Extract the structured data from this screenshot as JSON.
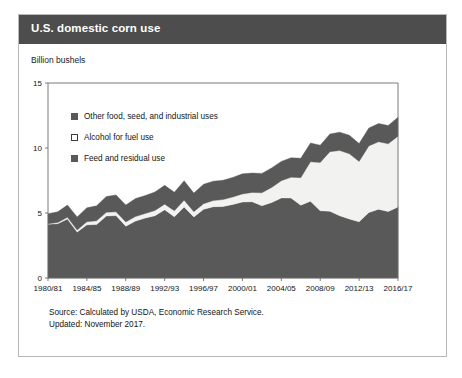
{
  "card": {
    "title": "U.S. domestic corn use",
    "header_color": "#4d4d4d",
    "border_color": "#b8b8b8"
  },
  "axis_label": "Billion bushels",
  "legend": {
    "items": [
      {
        "label": "Other food, seed, and industrial uses",
        "swatch": "filled",
        "color": "#595959"
      },
      {
        "label": "Alcohol for fuel use",
        "swatch": "hollow",
        "color": "#ffffff"
      },
      {
        "label": "Feed and residual use",
        "swatch": "filled",
        "color": "#595959"
      }
    ]
  },
  "footer": {
    "source": "Source: Calculated by USDA, Economic Research Service.",
    "updated": "Updated: November 2017."
  },
  "chart_data": {
    "type": "area",
    "stacked": true,
    "title": "U.S. domestic corn use",
    "xlabel": "",
    "ylabel": "Billion bushels",
    "ylim": [
      0,
      15
    ],
    "yticks": [
      0,
      5,
      10,
      15
    ],
    "ytick_labels": [
      "0",
      "5",
      "10",
      "15"
    ],
    "grid": false,
    "legend_position": "inside-top-left",
    "x": [
      "1980/81",
      "1981/82",
      "1982/83",
      "1983/84",
      "1984/85",
      "1985/86",
      "1986/87",
      "1987/88",
      "1988/89",
      "1989/90",
      "1990/91",
      "1991/92",
      "1992/93",
      "1993/94",
      "1994/95",
      "1995/96",
      "1996/97",
      "1997/98",
      "1998/99",
      "1999/00",
      "2000/01",
      "2001/02",
      "2002/03",
      "2003/04",
      "2004/05",
      "2005/06",
      "2006/07",
      "2007/08",
      "2008/09",
      "2009/10",
      "2010/11",
      "2011/12",
      "2012/13",
      "2013/14",
      "2014/15",
      "2015/16",
      "2016/17"
    ],
    "xtick_labels": [
      "1980/81",
      "1984/85",
      "1988/89",
      "1992/93",
      "1996/97",
      "2000/01",
      "2004/05",
      "2008/09",
      "2012/13",
      "2016/17"
    ],
    "xtick_indices": [
      0,
      4,
      8,
      12,
      16,
      20,
      24,
      28,
      32,
      36
    ],
    "series": [
      {
        "name": "Feed and residual use",
        "color": "#595959",
        "values": [
          4.14,
          4.18,
          4.54,
          3.53,
          4.09,
          4.12,
          4.77,
          4.8,
          3.99,
          4.38,
          4.61,
          4.79,
          5.25,
          4.71,
          5.46,
          4.7,
          5.28,
          5.48,
          5.5,
          5.66,
          5.84,
          5.87,
          5.56,
          5.8,
          6.16,
          6.15,
          5.6,
          5.91,
          5.18,
          5.13,
          4.79,
          4.54,
          4.32,
          5.04,
          5.28,
          5.11,
          5.47
        ]
      },
      {
        "name": "Alcohol for fuel use",
        "color": "#f2f2f0",
        "values": [
          0.04,
          0.08,
          0.13,
          0.16,
          0.23,
          0.28,
          0.28,
          0.29,
          0.32,
          0.35,
          0.35,
          0.4,
          0.43,
          0.46,
          0.53,
          0.4,
          0.43,
          0.48,
          0.53,
          0.57,
          0.63,
          0.71,
          0.996,
          1.17,
          1.32,
          1.6,
          2.12,
          3.03,
          3.71,
          4.59,
          5.02,
          5.01,
          4.65,
          5.12,
          5.2,
          5.21,
          5.44
        ]
      },
      {
        "name": "Other food, seed, and industrial uses",
        "color": "#595959",
        "values": [
          0.77,
          0.83,
          0.94,
          1.01,
          1.08,
          1.15,
          1.22,
          1.3,
          1.3,
          1.38,
          1.38,
          1.43,
          1.45,
          1.42,
          1.49,
          1.43,
          1.5,
          1.49,
          1.49,
          1.51,
          1.54,
          1.49,
          1.49,
          1.5,
          1.49,
          1.5,
          1.49,
          1.44,
          1.33,
          1.36,
          1.41,
          1.43,
          1.37,
          1.37,
          1.4,
          1.41,
          1.45
        ]
      }
    ]
  }
}
